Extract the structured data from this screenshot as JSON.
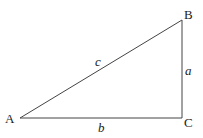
{
  "diagram": {
    "type": "right-triangle",
    "stroke_color": "#444444",
    "vertices": {
      "A": {
        "label": "A",
        "x": 20,
        "y": 118
      },
      "B": {
        "label": "B",
        "x": 182,
        "y": 20
      },
      "C": {
        "label": "C",
        "x": 182,
        "y": 118
      }
    },
    "sides": {
      "a": {
        "label": "a",
        "from": "B",
        "to": "C"
      },
      "b": {
        "label": "b",
        "from": "A",
        "to": "C"
      },
      "c": {
        "label": "c",
        "from": "A",
        "to": "B"
      }
    }
  }
}
